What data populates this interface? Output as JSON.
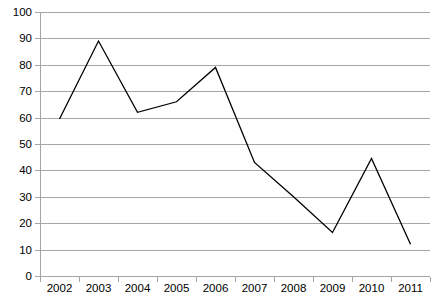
{
  "chart_data": {
    "type": "line",
    "title": "",
    "subtitle": "",
    "xlabel": "",
    "ylabel": "",
    "categories": [
      "2002",
      "2003",
      "2004",
      "2005",
      "2006",
      "2007",
      "2008",
      "2009",
      "2010",
      "2011"
    ],
    "values": [
      59.5,
      89,
      62,
      66,
      79,
      43,
      30,
      16.5,
      44.5,
      12
    ],
    "series": [
      {
        "name": "",
        "values": [
          59.5,
          89,
          62,
          66,
          79,
          43,
          30,
          16.5,
          44.5,
          12
        ],
        "color": "#000000"
      }
    ],
    "ylim": [
      0,
      100
    ],
    "ytick_values": [
      0,
      10,
      20,
      30,
      40,
      50,
      60,
      70,
      80,
      90,
      100
    ],
    "ytick_labels": [
      "0",
      "10",
      "20",
      "30",
      "40",
      "50",
      "60",
      "70",
      "80",
      "90",
      "100"
    ],
    "xtick_labels": [
      "2002",
      "2003",
      "2004",
      "2005",
      "2006",
      "2007",
      "2008",
      "2009",
      "2010",
      "2011"
    ],
    "grid": "horizontal",
    "grid_color": "#a6a6a6",
    "axis_color": "#a6a6a6",
    "background_color": "#ffffff",
    "legend": "none",
    "legend_position": "none",
    "annotations": []
  },
  "layout": {
    "plot_left": 40,
    "plot_right": 430,
    "plot_top": 12,
    "plot_bottom": 276,
    "tick_length": 5,
    "x_label_y": 284
  }
}
